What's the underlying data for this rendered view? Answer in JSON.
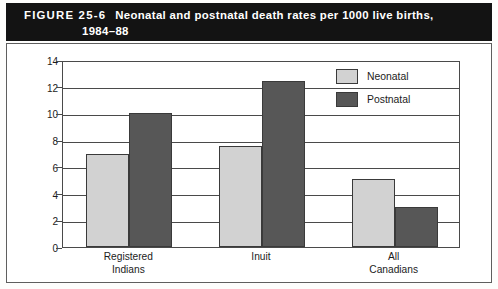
{
  "figure": {
    "number_label": "FIGURE 25-6",
    "title_line1": "Neonatal and postnatal death rates per 1000 live births,",
    "title_line2": "1984–88",
    "banner_bg": "#131313",
    "banner_fg": "#ffffff"
  },
  "legend": {
    "position": "top-right-inside-plot",
    "items": [
      {
        "label": "Neonatal",
        "color": "#d2d2d2",
        "swatch_name": "legend-swatch-neonatal"
      },
      {
        "label": "Postnatal",
        "color": "#575757",
        "swatch_name": "legend-swatch-postnatal"
      }
    ]
  },
  "chart_data": {
    "type": "bar",
    "title": "Neonatal and postnatal death rates per 1000 live births, 1984–88",
    "categories": [
      "Registered\nIndians",
      "Inuit",
      "All\nCanadians"
    ],
    "category_labels_flat": [
      "Registered Indians",
      "Inuit",
      "All Canadians"
    ],
    "series": [
      {
        "name": "Neonatal",
        "color": "#d2d2d2",
        "values": [
          7.0,
          7.6,
          5.1
        ]
      },
      {
        "name": "Postnatal",
        "color": "#575757",
        "values": [
          10.0,
          12.4,
          3.0
        ]
      }
    ],
    "xlabel": "",
    "ylabel": "",
    "ylim": [
      0,
      14
    ],
    "ytick_values": [
      0,
      2,
      4,
      6,
      8,
      10,
      12,
      14
    ],
    "ytick_labels": [
      "0",
      "2",
      "4",
      "6",
      "8",
      "10",
      "12",
      "14"
    ],
    "grid": true,
    "grid_axis": "y",
    "legend_position": "upper right"
  },
  "colors": {
    "neonatal": "#d2d2d2",
    "postnatal": "#575757",
    "axis": "#4a4a4a",
    "frame": "#5e5e5e",
    "text": "#1c1c1c",
    "background": "#ffffff"
  }
}
